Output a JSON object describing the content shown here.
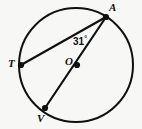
{
  "figure": {
    "background_color": "#f7f7f5",
    "stroke_color": "#101010",
    "circle": {
      "cx": 76,
      "cy": 65,
      "r": 57
    },
    "points": [
      {
        "id": "A",
        "label": "A",
        "x": 106,
        "y": 17,
        "label_x": 109,
        "label_y": 2
      },
      {
        "id": "T",
        "label": "T",
        "x": 21,
        "y": 65,
        "label_x": 8,
        "label_y": 58
      },
      {
        "id": "O",
        "label": "O",
        "x": 77,
        "y": 65,
        "label_x": 65,
        "label_y": 56
      },
      {
        "id": "V",
        "label": "V",
        "x": 45,
        "y": 108,
        "label_x": 37,
        "label_y": 113
      }
    ],
    "segments": [
      {
        "id": "chord-AT",
        "from": "A",
        "to": "T"
      },
      {
        "id": "diameter-AV",
        "from": "A",
        "to": "V"
      }
    ],
    "angle": {
      "id": "angle-TAV",
      "vertex": "A",
      "value": "31",
      "unit": "°",
      "text": "31°"
    }
  }
}
